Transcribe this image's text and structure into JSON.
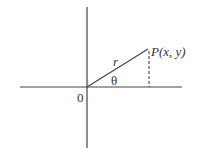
{
  "diagram": {
    "type": "polar-coordinate-diagram",
    "labels": {
      "origin": "0",
      "radius": "r",
      "angle": "θ",
      "point": "P(x, y)"
    },
    "colors": {
      "stroke": "#333333",
      "background": "#ffffff"
    }
  }
}
